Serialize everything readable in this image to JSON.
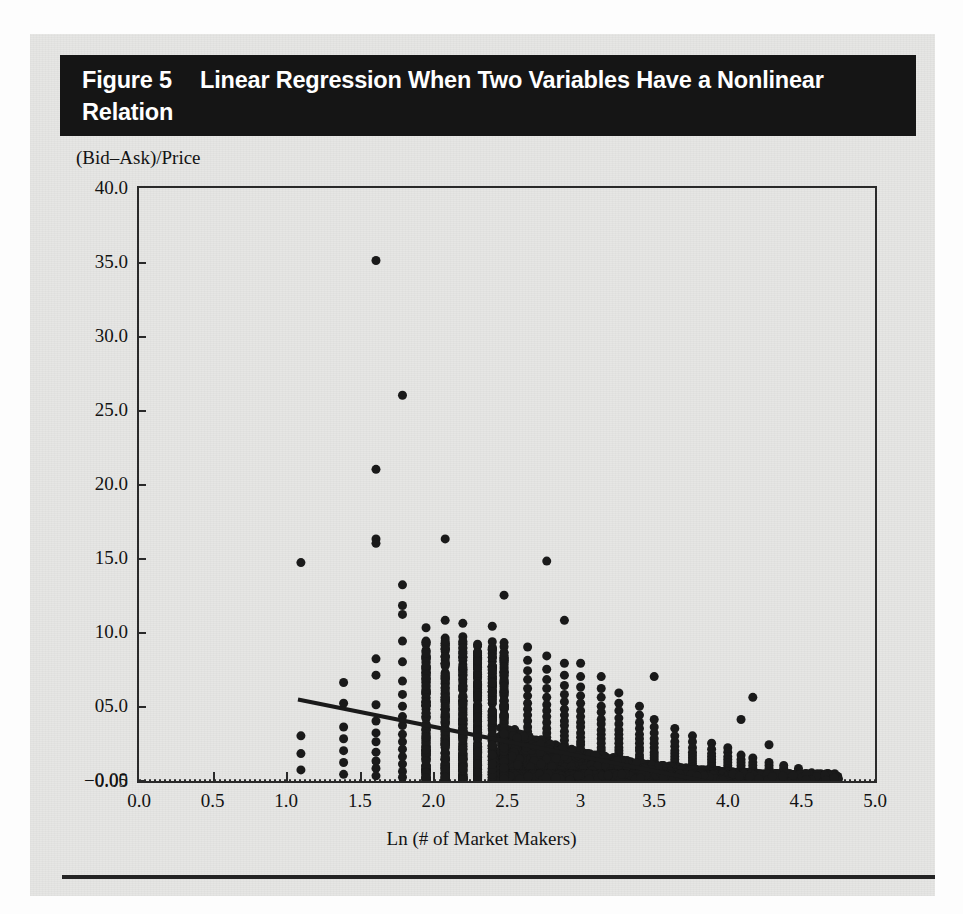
{
  "figure": {
    "number_label": "Figure 5",
    "caption": "Linear Regression When Two Variables Have a Nonlinear Relation",
    "panel_bg": "#e6e6e4",
    "title_bar_bg": "#151515",
    "title_text_color": "#ffffff",
    "ink_color": "#1a1a1a"
  },
  "chart_data": {
    "type": "scatter",
    "title": "Linear Regression When Two Variables Have a Nonlinear Relation",
    "xlabel": "Ln (# of Market Makers)",
    "ylabel": "(Bid–Ask)/Price",
    "xlim": [
      0.0,
      5.0
    ],
    "ylim": [
      -0.05,
      40.0
    ],
    "grid": false,
    "legend": null,
    "xticks": [
      0.0,
      0.5,
      1.0,
      1.5,
      2.0,
      2.5,
      3.0,
      3.5,
      4.0,
      4.5,
      5.0
    ],
    "xtick_labels": [
      "0.0",
      "0.5",
      "1.0",
      "1.5",
      "2.0",
      "2.5",
      "3",
      "3.5",
      "4.0",
      "4.5",
      "5.0"
    ],
    "yticks": [
      40.0,
      35.0,
      30.0,
      25.0,
      20.0,
      15.0,
      10.0,
      5.0,
      0.0,
      -0.05
    ],
    "ytick_labels": [
      "40.0",
      "35.0",
      "30.0",
      "25.0",
      "20.0",
      "15.0",
      "10.0",
      "05.0",
      "0.00",
      "−0.05"
    ],
    "marker": "filled-circle",
    "marker_color": "#1a1a1a",
    "marker_size_px": 9,
    "zero_reference_line": {
      "y": 0.0,
      "style": "dotted",
      "color": "#2a2a2a"
    },
    "regression_line": {
      "label": "ordinary least squares fit",
      "style": "solid",
      "color": "#1a1a1a",
      "width_px": 4,
      "x_start": 1.08,
      "y_start": 5.45,
      "x_end": 4.74,
      "y_end": -1.85,
      "slope": -1.995,
      "intercept": 7.605
    },
    "annotation": "Scatter shows strongly convex (nonlinear) decay of bid-ask spread with Ln(# of market makers); fitted straight line misses the curvature.",
    "columns": [
      {
        "x": 1.1,
        "n": 4,
        "y_values": [
          14.7,
          3.0,
          1.8,
          0.7
        ]
      },
      {
        "x": 1.39,
        "n": 7,
        "y_values": [
          6.6,
          5.2,
          3.6,
          2.8,
          2.0,
          1.2,
          0.4
        ]
      },
      {
        "x": 1.61,
        "n": 14,
        "y_values": [
          35.1,
          21.0,
          16.3,
          16.0,
          8.2,
          7.1,
          5.1,
          4.0,
          3.2,
          2.6,
          1.9,
          1.3,
          0.8,
          0.3
        ]
      },
      {
        "x": 1.79,
        "n": 18,
        "y_values": [
          26.0,
          13.2,
          11.8,
          11.2,
          9.4,
          8.0,
          6.7,
          5.8,
          5.0,
          4.3,
          3.7,
          3.1,
          2.6,
          2.1,
          1.6,
          1.1,
          0.6,
          0.2
        ]
      },
      {
        "x": 1.95,
        "n": 20,
        "y_values": [
          10.3,
          9.4,
          8.3,
          7.4,
          6.6,
          5.9,
          5.3,
          4.8,
          4.3,
          3.8,
          3.4,
          3.0,
          2.6,
          2.2,
          1.8,
          1.4,
          1.0,
          0.7,
          0.4,
          0.1
        ]
      },
      {
        "x": 2.08,
        "n": 22,
        "y_values": [
          16.3,
          10.8,
          9.6,
          8.7,
          7.9,
          7.2,
          6.5,
          5.9,
          5.3,
          4.8,
          4.3,
          3.8,
          3.4,
          3.0,
          2.6,
          2.2,
          1.8,
          1.4,
          1.1,
          0.8,
          0.4,
          0.1
        ]
      },
      {
        "x": 2.2,
        "n": 22,
        "y_values": [
          10.6,
          9.7,
          8.9,
          8.1,
          7.4,
          6.8,
          6.2,
          5.6,
          5.1,
          4.6,
          4.1,
          3.7,
          3.3,
          2.9,
          2.5,
          2.1,
          1.7,
          1.4,
          1.0,
          0.7,
          0.4,
          0.1
        ]
      },
      {
        "x": 2.3,
        "n": 20,
        "y_values": [
          8.3,
          7.6,
          7.0,
          6.4,
          5.9,
          5.4,
          4.9,
          4.4,
          4.0,
          3.6,
          3.2,
          2.8,
          2.5,
          2.1,
          1.8,
          1.4,
          1.1,
          0.8,
          0.5,
          0.2
        ]
      },
      {
        "x": 2.4,
        "n": 20,
        "y_values": [
          10.4,
          8.6,
          7.7,
          7.0,
          6.3,
          5.7,
          5.2,
          4.7,
          4.2,
          3.8,
          3.4,
          3.0,
          2.6,
          2.3,
          1.9,
          1.6,
          1.2,
          0.9,
          0.6,
          0.2
        ]
      },
      {
        "x": 2.48,
        "n": 20,
        "y_values": [
          12.5,
          9.3,
          8.1,
          7.3,
          6.6,
          6.0,
          5.4,
          4.9,
          4.4,
          4.0,
          3.6,
          3.2,
          2.8,
          2.4,
          2.1,
          1.7,
          1.4,
          1.0,
          0.7,
          0.3
        ]
      },
      {
        "x": 2.64,
        "n": 24,
        "y_values": [
          9.0,
          8.1,
          7.4,
          6.8,
          6.2,
          5.7,
          5.2,
          4.8,
          4.4,
          4.0,
          3.6,
          3.3,
          3.0,
          2.7,
          2.4,
          2.1,
          1.8,
          1.5,
          1.2,
          0.9,
          0.7,
          0.5,
          0.3,
          0.1
        ]
      },
      {
        "x": 2.77,
        "n": 24,
        "y_values": [
          14.8,
          8.4,
          7.5,
          6.8,
          6.2,
          5.6,
          5.1,
          4.7,
          4.3,
          3.9,
          3.5,
          3.2,
          2.9,
          2.6,
          2.3,
          2.0,
          1.7,
          1.5,
          1.2,
          1.0,
          0.7,
          0.5,
          0.3,
          0.1
        ]
      },
      {
        "x": 2.89,
        "n": 24,
        "y_values": [
          10.8,
          7.9,
          7.1,
          6.4,
          5.8,
          5.3,
          4.8,
          4.4,
          4.0,
          3.7,
          3.3,
          3.0,
          2.7,
          2.4,
          2.2,
          1.9,
          1.6,
          1.4,
          1.1,
          0.9,
          0.7,
          0.5,
          0.3,
          0.1
        ]
      },
      {
        "x": 3.0,
        "n": 24,
        "y_values": [
          7.9,
          7.0,
          6.3,
          5.7,
          5.2,
          4.7,
          4.3,
          3.9,
          3.6,
          3.2,
          2.9,
          2.6,
          2.4,
          2.1,
          1.9,
          1.6,
          1.4,
          1.2,
          1.0,
          0.8,
          0.6,
          0.4,
          0.2,
          0.1
        ]
      },
      {
        "x": 3.14,
        "n": 22,
        "y_values": [
          7.0,
          6.2,
          5.6,
          5.0,
          4.6,
          4.1,
          3.8,
          3.4,
          3.1,
          2.8,
          2.5,
          2.2,
          2.0,
          1.7,
          1.5,
          1.3,
          1.1,
          0.9,
          0.7,
          0.5,
          0.3,
          0.1
        ]
      },
      {
        "x": 3.26,
        "n": 22,
        "y_values": [
          5.9,
          5.2,
          4.7,
          4.2,
          3.8,
          3.4,
          3.1,
          2.8,
          2.5,
          2.2,
          2.0,
          1.8,
          1.5,
          1.3,
          1.1,
          0.9,
          0.8,
          0.6,
          0.5,
          0.3,
          0.2,
          0.1
        ]
      },
      {
        "x": 3.4,
        "n": 20,
        "y_values": [
          5.0,
          4.4,
          3.9,
          3.5,
          3.1,
          2.8,
          2.5,
          2.2,
          2.0,
          1.7,
          1.5,
          1.3,
          1.1,
          0.9,
          0.8,
          0.6,
          0.5,
          0.3,
          0.2,
          0.1
        ]
      },
      {
        "x": 3.5,
        "n": 18,
        "y_values": [
          7.0,
          4.1,
          3.6,
          3.2,
          2.8,
          2.5,
          2.2,
          1.9,
          1.7,
          1.5,
          1.3,
          1.1,
          0.9,
          0.7,
          0.6,
          0.4,
          0.3,
          0.1
        ]
      },
      {
        "x": 3.64,
        "n": 18,
        "y_values": [
          3.5,
          3.0,
          2.6,
          2.3,
          2.0,
          1.8,
          1.6,
          1.4,
          1.2,
          1.0,
          0.9,
          0.7,
          0.6,
          0.5,
          0.4,
          0.3,
          0.2,
          0.1
        ]
      },
      {
        "x": 3.76,
        "n": 16,
        "y_values": [
          3.0,
          2.6,
          2.2,
          1.9,
          1.7,
          1.5,
          1.3,
          1.1,
          0.9,
          0.8,
          0.6,
          0.5,
          0.4,
          0.3,
          0.2,
          0.1
        ]
      },
      {
        "x": 3.89,
        "n": 16,
        "y_values": [
          2.5,
          2.1,
          1.8,
          1.6,
          1.4,
          1.2,
          1.0,
          0.9,
          0.7,
          0.6,
          0.5,
          0.4,
          0.3,
          0.2,
          0.1,
          0.05
        ]
      },
      {
        "x": 4.0,
        "n": 14,
        "y_values": [
          2.2,
          1.9,
          1.6,
          1.4,
          1.2,
          1.0,
          0.8,
          0.7,
          0.6,
          0.5,
          0.4,
          0.3,
          0.2,
          0.1
        ]
      },
      {
        "x": 4.09,
        "n": 12,
        "y_values": [
          4.1,
          1.7,
          1.4,
          1.2,
          1.0,
          0.8,
          0.7,
          0.6,
          0.4,
          0.3,
          0.2,
          0.1
        ]
      },
      {
        "x": 4.17,
        "n": 10,
        "y_values": [
          5.6,
          1.5,
          1.2,
          1.0,
          0.8,
          0.6,
          0.5,
          0.4,
          0.2,
          0.1
        ]
      },
      {
        "x": 4.28,
        "n": 9,
        "y_values": [
          2.4,
          1.2,
          1.0,
          0.8,
          0.6,
          0.5,
          0.3,
          0.2,
          0.1
        ]
      },
      {
        "x": 4.38,
        "n": 7,
        "y_values": [
          1.0,
          0.8,
          0.6,
          0.5,
          0.3,
          0.2,
          0.1
        ]
      },
      {
        "x": 4.48,
        "n": 6,
        "y_values": [
          0.8,
          0.6,
          0.5,
          0.3,
          0.2,
          0.1
        ]
      },
      {
        "x": 4.57,
        "n": 4,
        "y_values": [
          0.5,
          0.3,
          0.2,
          0.1
        ]
      },
      {
        "x": 4.65,
        "n": 3,
        "y_values": [
          0.3,
          0.2,
          0.1
        ]
      },
      {
        "x": 4.72,
        "n": 2,
        "y_values": [
          0.2,
          0.1
        ]
      }
    ],
    "notable_outliers": [
      {
        "x": 1.61,
        "y": 35.1
      },
      {
        "x": 1.79,
        "y": 26.0
      },
      {
        "x": 1.61,
        "y": 21.0
      },
      {
        "x": 1.61,
        "y": 16.3
      },
      {
        "x": 2.08,
        "y": 16.3
      },
      {
        "x": 2.77,
        "y": 14.8
      },
      {
        "x": 1.1,
        "y": 14.7
      },
      {
        "x": 1.79,
        "y": 13.2
      },
      {
        "x": 2.48,
        "y": 12.5
      },
      {
        "x": 2.89,
        "y": 10.8
      },
      {
        "x": 4.17,
        "y": 5.6
      }
    ]
  },
  "axis_titles": {
    "x": "Ln (# of Market Makers)",
    "y": "(Bid–Ask)/Price"
  }
}
